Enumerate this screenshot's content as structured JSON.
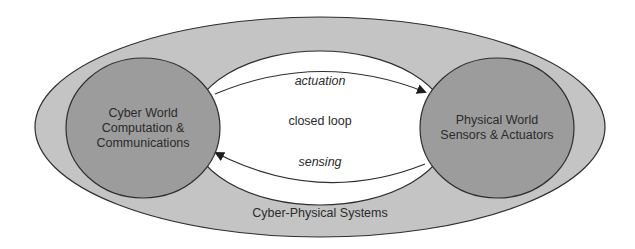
{
  "diagram": {
    "title": "Cyber-Physical Systems",
    "outer_label": "Cyber-Physical Systems",
    "center_label": "closed loop",
    "cyber_world": {
      "line1": "Cyber World",
      "line2": "Computation &",
      "line3": "Communications"
    },
    "physical_world": {
      "line1": "Physical World",
      "line2": "Sensors & Actuators"
    },
    "arrows": {
      "top": "actuation",
      "bottom": "sensing"
    },
    "colors": {
      "background": "#ffffff",
      "outer_ellipse": "#c4c4c4",
      "inner_circles": "#9c9c9c",
      "ring": "#ffffff",
      "stroke": "#2e2e2e",
      "text": "#2b2b2b"
    }
  }
}
